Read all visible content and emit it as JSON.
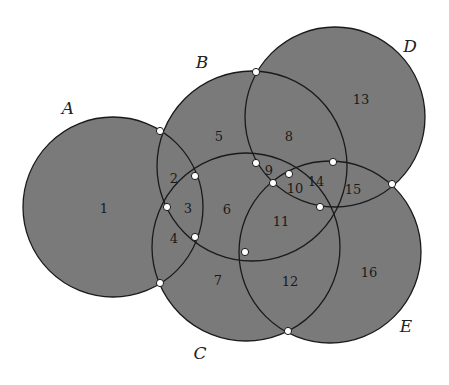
{
  "diagram": {
    "fill_color": "#7a7a7a",
    "stroke_color": "#1a1a1a",
    "vertex_fill": "#ffffff",
    "circles": [
      {
        "name": "A",
        "cx": 113,
        "cy": 207,
        "r": 90,
        "label_x": 68,
        "label_y": 108
      },
      {
        "name": "B",
        "cx": 252,
        "cy": 166,
        "r": 95,
        "label_x": 202,
        "label_y": 62
      },
      {
        "name": "C",
        "cx": 246,
        "cy": 247,
        "r": 94,
        "label_x": 200,
        "label_y": 353
      },
      {
        "name": "D",
        "cx": 335,
        "cy": 117,
        "r": 90,
        "label_x": 410,
        "label_y": 46
      },
      {
        "name": "E",
        "cx": 330,
        "cy": 252,
        "r": 91,
        "label_x": 406,
        "label_y": 326
      }
    ],
    "regions": [
      {
        "id": "1",
        "x": 104,
        "y": 208
      },
      {
        "id": "2",
        "x": 174,
        "y": 178
      },
      {
        "id": "3",
        "x": 188,
        "y": 208
      },
      {
        "id": "4",
        "x": 174,
        "y": 238
      },
      {
        "id": "5",
        "x": 219,
        "y": 136
      },
      {
        "id": "6",
        "x": 227,
        "y": 209
      },
      {
        "id": "7",
        "x": 218,
        "y": 280
      },
      {
        "id": "8",
        "x": 289,
        "y": 136
      },
      {
        "id": "9",
        "x": 269,
        "y": 170
      },
      {
        "id": "10",
        "x": 295,
        "y": 188
      },
      {
        "id": "11",
        "x": 281,
        "y": 221
      },
      {
        "id": "12",
        "x": 290,
        "y": 281
      },
      {
        "id": "13",
        "x": 361,
        "y": 99
      },
      {
        "id": "14",
        "x": 316,
        "y": 181
      },
      {
        "id": "15",
        "x": 353,
        "y": 189
      },
      {
        "id": "16",
        "x": 369,
        "y": 272
      }
    ],
    "vertices": [
      {
        "x": 160,
        "y": 131
      },
      {
        "x": 195,
        "y": 176
      },
      {
        "x": 167,
        "y": 207
      },
      {
        "x": 195,
        "y": 237
      },
      {
        "x": 160,
        "y": 283
      },
      {
        "x": 256,
        "y": 72
      },
      {
        "x": 256,
        "y": 163
      },
      {
        "x": 273,
        "y": 183
      },
      {
        "x": 289,
        "y": 174
      },
      {
        "x": 320,
        "y": 207
      },
      {
        "x": 333,
        "y": 162
      },
      {
        "x": 392,
        "y": 184
      },
      {
        "x": 245,
        "y": 252
      },
      {
        "x": 288,
        "y": 331
      }
    ]
  }
}
